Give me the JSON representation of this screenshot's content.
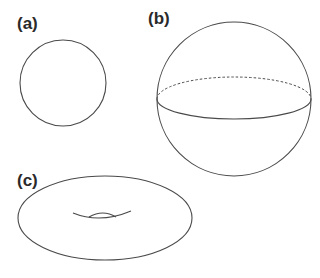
{
  "figure": {
    "panels": [
      {
        "id": "a",
        "label": "(a)",
        "shape": "circle",
        "description": "circle outline"
      },
      {
        "id": "b",
        "label": "(b)",
        "shape": "sphere",
        "description": "sphere with equator ellipse; back half dashed, front half solid"
      },
      {
        "id": "c",
        "label": "(c)",
        "shape": "torus",
        "description": "torus outline with central hole curves"
      }
    ],
    "colors": {
      "stroke": "#4a4a4a",
      "label": "#2a2a2a",
      "background": "#ffffff"
    }
  }
}
